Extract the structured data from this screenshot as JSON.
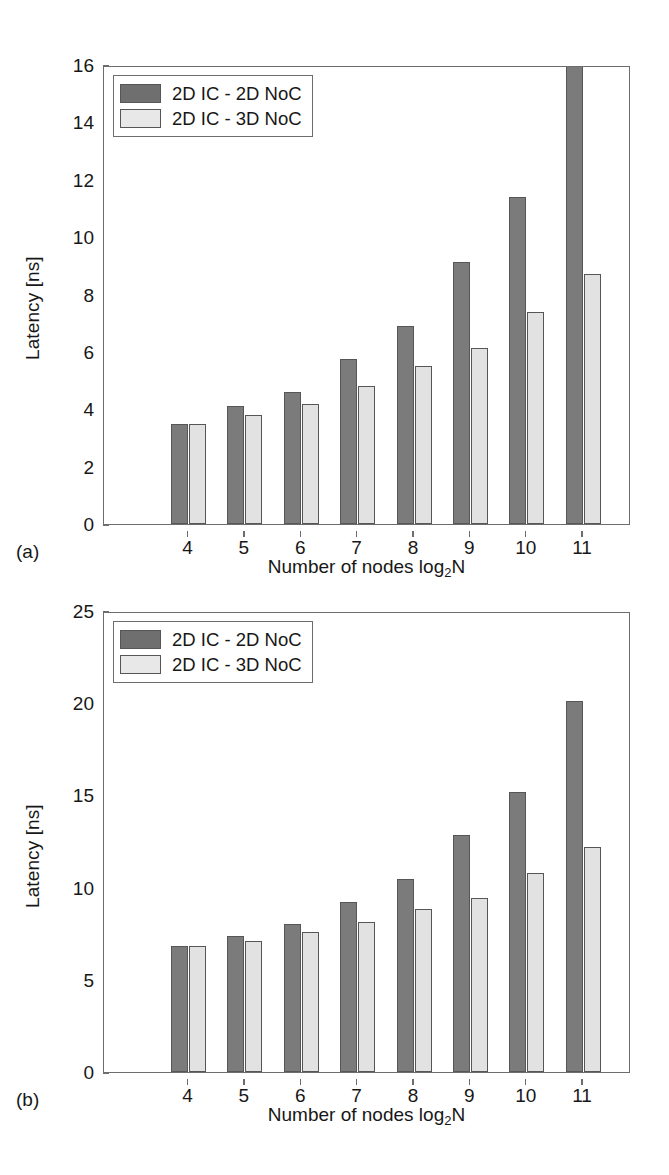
{
  "figure": {
    "panels": [
      {
        "caption": "(a)",
        "legend": [
          {
            "label": "2D IC - 2D NoC",
            "swatch": "dark",
            "color": "#6f6f6f"
          },
          {
            "label": "2D IC - 3D NoC",
            "swatch": "light",
            "color": "#e8e8e8"
          }
        ]
      },
      {
        "caption": "(b)",
        "legend": [
          {
            "label": "2D IC - 2D NoC",
            "swatch": "dark",
            "color": "#6f6f6f"
          },
          {
            "label": "2D IC - 3D NoC",
            "swatch": "light",
            "color": "#e8e8e8"
          }
        ]
      }
    ]
  },
  "chart_data": [
    {
      "type": "bar",
      "panel": "(a)",
      "title": "",
      "xlabel": "Number of nodes log2N",
      "xlabel_base": "Number of nodes log",
      "xlabel_sub": "2",
      "xlabel_tail": "N",
      "ylabel": "Latency [ns]",
      "categories": [
        "4",
        "5",
        "6",
        "7",
        "8",
        "9",
        "10",
        "11"
      ],
      "ylim": [
        0,
        16
      ],
      "yticks": [
        0,
        2,
        4,
        6,
        8,
        10,
        12,
        14,
        16
      ],
      "grid": false,
      "legend_position": "upper left",
      "series": [
        {
          "name": "2D IC - 2D NoC",
          "color": "#7b7b7b",
          "values": [
            3.5,
            4.1,
            4.6,
            5.75,
            6.9,
            9.15,
            11.4,
            16.0
          ],
          "clipped_last": true
        },
        {
          "name": "2D IC - 3D NoC",
          "color": "#e2e2e2",
          "values": [
            3.5,
            3.8,
            4.2,
            4.8,
            5.5,
            6.15,
            7.4,
            8.7
          ]
        }
      ]
    },
    {
      "type": "bar",
      "panel": "(b)",
      "title": "",
      "xlabel": "Number of nodes log2N",
      "xlabel_base": "Number of nodes log",
      "xlabel_sub": "2",
      "xlabel_tail": "N",
      "ylabel": "Latency [ns]",
      "categories": [
        "4",
        "5",
        "6",
        "7",
        "8",
        "9",
        "10",
        "11"
      ],
      "ylim": [
        0,
        25
      ],
      "yticks": [
        0,
        5,
        10,
        15,
        20,
        25
      ],
      "grid": false,
      "legend_position": "upper left",
      "series": [
        {
          "name": "2D IC - 2D NoC",
          "color": "#7b7b7b",
          "values": [
            6.85,
            7.4,
            8.0,
            9.2,
            10.45,
            12.85,
            15.2,
            20.1
          ]
        },
        {
          "name": "2D IC - 3D NoC",
          "color": "#e2e2e2",
          "values": [
            6.85,
            7.1,
            7.6,
            8.15,
            8.85,
            9.45,
            10.8,
            12.2
          ]
        }
      ]
    }
  ]
}
